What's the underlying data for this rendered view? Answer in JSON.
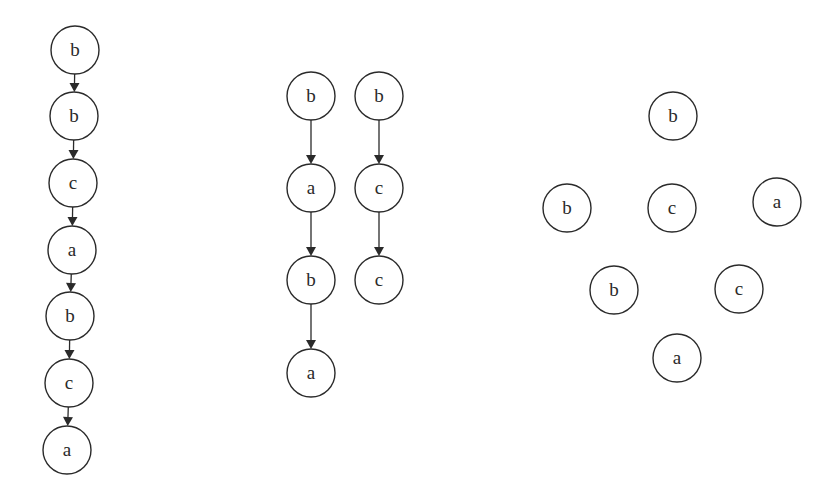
{
  "diagram": {
    "node_radius": 24,
    "colors": {
      "stroke": "#2a2a2a",
      "background": "#ffffff",
      "node_fill": "#ffffff"
    },
    "graphs": [
      {
        "id": "chain-graph",
        "nodes": [
          {
            "id": "n1",
            "label": "b",
            "x": 75,
            "y": 50
          },
          {
            "id": "n2",
            "label": "b",
            "x": 74,
            "y": 116
          },
          {
            "id": "n3",
            "label": "c",
            "x": 73,
            "y": 183
          },
          {
            "id": "n4",
            "label": "a",
            "x": 72,
            "y": 250
          },
          {
            "id": "n5",
            "label": "b",
            "x": 70,
            "y": 316
          },
          {
            "id": "n6",
            "label": "c",
            "x": 69,
            "y": 383
          },
          {
            "id": "n7",
            "label": "a",
            "x": 67,
            "y": 450
          }
        ],
        "edges": [
          [
            "n1",
            "n2"
          ],
          [
            "n2",
            "n3"
          ],
          [
            "n3",
            "n4"
          ],
          [
            "n4",
            "n5"
          ],
          [
            "n5",
            "n6"
          ],
          [
            "n6",
            "n7"
          ]
        ]
      },
      {
        "id": "two-chains-graph",
        "nodes": [
          {
            "id": "m1",
            "label": "b",
            "x": 311,
            "y": 96
          },
          {
            "id": "m2",
            "label": "a",
            "x": 311,
            "y": 188
          },
          {
            "id": "m3",
            "label": "b",
            "x": 311,
            "y": 280
          },
          {
            "id": "m4",
            "label": "a",
            "x": 311,
            "y": 373
          },
          {
            "id": "m5",
            "label": "b",
            "x": 379,
            "y": 96
          },
          {
            "id": "m6",
            "label": "c",
            "x": 379,
            "y": 188
          },
          {
            "id": "m7",
            "label": "c",
            "x": 379,
            "y": 280
          }
        ],
        "edges": [
          [
            "m1",
            "m2"
          ],
          [
            "m2",
            "m3"
          ],
          [
            "m3",
            "m4"
          ],
          [
            "m5",
            "m6"
          ],
          [
            "m6",
            "m7"
          ]
        ]
      },
      {
        "id": "unconnected-graph",
        "nodes": [
          {
            "id": "r1",
            "label": "b",
            "x": 673,
            "y": 116
          },
          {
            "id": "r2",
            "label": "b",
            "x": 567,
            "y": 208
          },
          {
            "id": "r3",
            "label": "c",
            "x": 672,
            "y": 208
          },
          {
            "id": "r4",
            "label": "a",
            "x": 777,
            "y": 202
          },
          {
            "id": "r5",
            "label": "b",
            "x": 614,
            "y": 290
          },
          {
            "id": "r6",
            "label": "c",
            "x": 739,
            "y": 289
          },
          {
            "id": "r7",
            "label": "a",
            "x": 677,
            "y": 358
          }
        ],
        "edges": []
      }
    ]
  }
}
